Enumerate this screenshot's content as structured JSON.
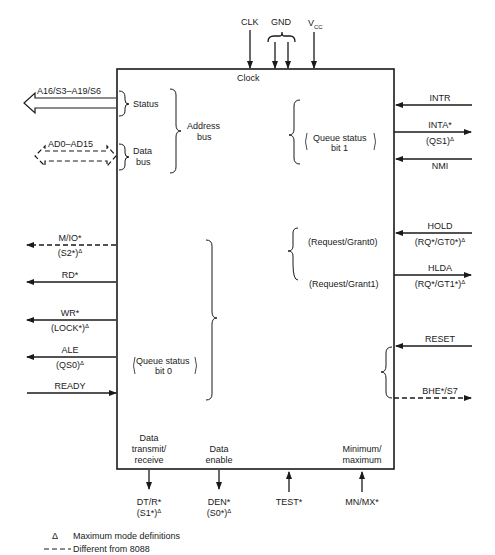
{
  "chip": {
    "internal_labels": {
      "clock": "Clock",
      "status": "Status",
      "data_bus_1": "Data",
      "data_bus_2": "bus",
      "address_bus_1": "Address",
      "address_bus_2": "bus",
      "queue_status_bit1_1": "Queue status",
      "queue_status_bit1_2": "bit 1",
      "request_grant0": "(Request/Grant0)",
      "request_grant1": "(Request/Grant1)",
      "queue_status_bit0_1": "Queue status",
      "queue_status_bit0_2": "bit 0",
      "data_transmit_1": "Data",
      "data_transmit_2": "transmit/",
      "data_transmit_3": "receive",
      "data_enable_1": "Data",
      "data_enable_2": "enable",
      "min_max_1": "Minimum/",
      "min_max_2": "maximum"
    }
  },
  "top_pins": {
    "clk": "CLK",
    "gnd": "GND",
    "vcc_base": "V",
    "vcc_sub": "CC"
  },
  "left_pins": {
    "a16": "A16/S3–A19/S6",
    "ad": "AD0–AD15",
    "mio": "M/IO*",
    "mio_max": "(S2*)",
    "rd": "RD*",
    "wr": "WR*",
    "wr_max": "(LOCK*)",
    "ale": "ALE",
    "ale_max": "(QS0)",
    "ready": "READY"
  },
  "right_pins": {
    "intr": "INTR",
    "inta": "INTA*",
    "inta_max": "(QS1)",
    "nmi": "NMI",
    "hold": "HOLD",
    "hold_max": "(RQ*/GT0*)",
    "hlda": "HLDA",
    "hlda_max": "(RQ*/GT1*)",
    "reset": "RESET",
    "bhe": "BHE*/S7"
  },
  "bottom_pins": {
    "dtr": "DT/R*",
    "dtr_max": "(S1*)",
    "den": "DEN*",
    "den_max": "(S0*)",
    "test": "TEST*",
    "mnmx": "MN/MX*"
  },
  "legend": {
    "delta_symbol": "Δ",
    "max_mode": "Maximum mode definitions",
    "dashed_symbol": "– – –",
    "different": "Different from 8088"
  },
  "delta": "Δ"
}
